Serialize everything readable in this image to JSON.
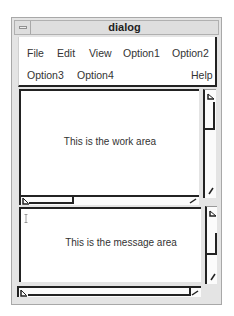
{
  "window": {
    "title": "dialog",
    "minimize_icon": "window-menu-icon"
  },
  "menubar": {
    "items": [
      {
        "label": "File"
      },
      {
        "label": "Edit"
      },
      {
        "label": "View"
      },
      {
        "label": "Option1"
      },
      {
        "label": "Option2"
      },
      {
        "label": "Option3"
      },
      {
        "label": "Option4"
      },
      {
        "label": "Help"
      }
    ]
  },
  "work_area": {
    "text": "This is the work area"
  },
  "message_area": {
    "text": "This is the message area"
  },
  "colors": {
    "frame": "#e4e4e4",
    "border_dark": "#222222",
    "text": "#333333",
    "background": "#ffffff"
  }
}
